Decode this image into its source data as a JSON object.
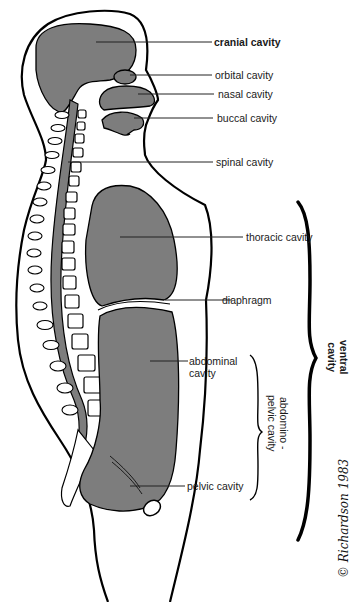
{
  "diagram": {
    "colors": {
      "cavity_fill": "#7d7d7d",
      "outline": "#000000",
      "background": "#ffffff",
      "text": "#1a1a1a"
    },
    "labels": {
      "cranial": "cranial  cavity",
      "orbital": "orbital cavity",
      "nasal": "nasal cavity",
      "buccal": "buccal cavity",
      "spinal": "spinal cavity",
      "thoracic": "thoracic cavity",
      "diaphragm": "diaphragm",
      "abdominal": "abdominal\ncavity",
      "pelvic": "pelvic cavity"
    },
    "brackets": {
      "ventral": "ventral\ncavity",
      "abdominopelvic": "abdomino -\npelvic cavity"
    },
    "signature": "© Richardson 1983"
  }
}
